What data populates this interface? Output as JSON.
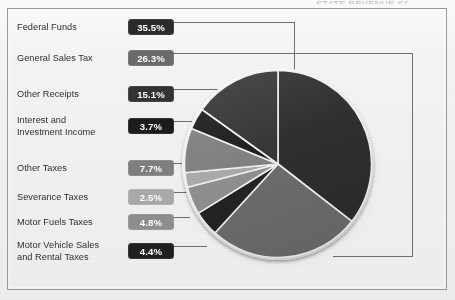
{
  "figure": {
    "title_sliver": "STATE REVENUE SOURCES",
    "background_color": "#f1f1f0",
    "frame_color": "#9b9b9b",
    "leader_line_color": "#6e6e6e"
  },
  "legend": {
    "items": [
      {
        "label": "Federal Funds",
        "value": "35.5%",
        "swatch": "#2b2b2b",
        "text_color": "#ffffff",
        "top": 14
      },
      {
        "label": "General Sales Tax",
        "value": "26.3%",
        "swatch": "#6a6a6a",
        "text_color": "#ffffff",
        "top": 45
      },
      {
        "label": "Other Receipts",
        "value": "15.1%",
        "swatch": "#333333",
        "text_color": "#ffffff",
        "top": 81
      },
      {
        "label": "Interest and\nInvestment Income",
        "value": "3.7%",
        "swatch": "#1b1b1b",
        "text_color": "#ffffff",
        "top": 113
      },
      {
        "label": "Other Taxes",
        "value": "7.7%",
        "swatch": "#7f7f7f",
        "text_color": "#ffffff",
        "top": 155
      },
      {
        "label": "Severance Taxes",
        "value": "2.5%",
        "swatch": "#a9a9a9",
        "text_color": "#ffffff",
        "top": 184
      },
      {
        "label": "Motor Fuels Taxes",
        "value": "4.8%",
        "swatch": "#8e8e8e",
        "text_color": "#ffffff",
        "top": 209
      },
      {
        "label": "Motor Vehicle Sales\nand Rental Taxes",
        "value": "4.4%",
        "swatch": "#202020",
        "text_color": "#ffffff",
        "top": 238
      }
    ]
  },
  "chart_data": {
    "type": "pie",
    "title": "",
    "legend_position": "left",
    "units": "percent",
    "total": 100.0,
    "start_angle_deg": 0,
    "direction": "clockwise",
    "categories": [
      "Federal Funds",
      "General Sales Tax",
      "Motor Vehicle Sales and Rental Taxes",
      "Motor Fuels Taxes",
      "Severance Taxes",
      "Other Taxes",
      "Interest and Investment Income",
      "Other Receipts"
    ],
    "values": [
      35.5,
      26.3,
      4.4,
      4.8,
      2.5,
      7.7,
      3.7,
      15.1
    ],
    "colors": [
      "#2b2b2b",
      "#6a6a6a",
      "#202020",
      "#8e8e8e",
      "#a9a9a9",
      "#7f7f7f",
      "#1b1b1b",
      "#333333"
    ],
    "labels": [
      "35.5%",
      "26.3%",
      "4.4%",
      "4.8%",
      "2.5%",
      "7.7%",
      "3.7%",
      "15.1%"
    ],
    "slice_separator_color": "#f0f0ef"
  }
}
